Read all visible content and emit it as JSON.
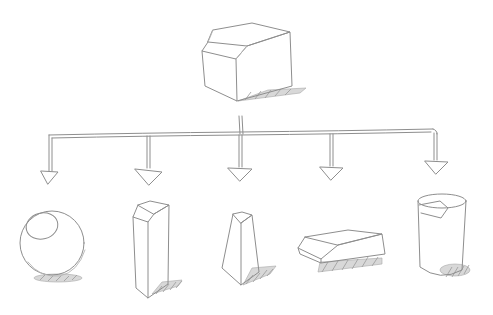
{
  "diagram": {
    "type": "hand-drawn sketch tree",
    "stroke_color": "#8e8e8e",
    "background": "#ffffff",
    "root": {
      "id": "root",
      "shape": "chamfered cube",
      "label": ""
    },
    "connector": {
      "style": "double-line branching arrows",
      "branch_count": 5
    },
    "children": [
      {
        "id": "child-1",
        "shape": "sphere with highlight",
        "label": ""
      },
      {
        "id": "child-2",
        "shape": "tall chamfered prism",
        "label": ""
      },
      {
        "id": "child-3",
        "shape": "tapered chamfered prism",
        "label": ""
      },
      {
        "id": "child-4",
        "shape": "flat chamfered slab",
        "label": ""
      },
      {
        "id": "child-5",
        "shape": "chamfered cylinder",
        "label": ""
      }
    ]
  }
}
